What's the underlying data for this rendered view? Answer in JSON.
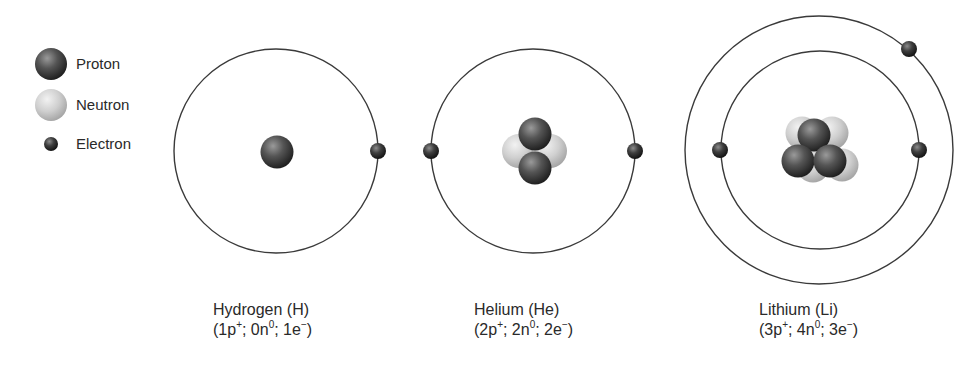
{
  "legend": {
    "items": [
      {
        "label": "Proton",
        "type": "proton"
      },
      {
        "label": "Neutron",
        "type": "neutron"
      },
      {
        "label": "Electron",
        "type": "electron"
      }
    ]
  },
  "colors": {
    "proton_dark": "#2b2b2b",
    "proton_light": "#8a8a8a",
    "neutron_dark": "#9c9c9c",
    "neutron_light": "#e6e6e6",
    "orbit": "#3a3a3a"
  },
  "atoms": [
    {
      "name": "Hydrogen (H)",
      "protons": "1",
      "neutrons": "0",
      "electrons": "1",
      "formula_parts": {
        "p": "(1p",
        "n": "; 0n",
        "e": "; 1e",
        "close": ")"
      }
    },
    {
      "name": "Helium (He)",
      "protons": "2",
      "neutrons": "2",
      "electrons": "2",
      "formula_parts": {
        "p": "(2p",
        "n": "; 2n",
        "e": "; 2e",
        "close": ")"
      }
    },
    {
      "name": "Lithium (Li)",
      "protons": "3",
      "neutrons": "4",
      "electrons": "3",
      "formula_parts": {
        "p": "(3p",
        "n": "; 4n",
        "e": "; 3e",
        "close": ")"
      }
    }
  ],
  "superscripts": {
    "proton": "+",
    "neutron": "0",
    "electron": "−"
  }
}
